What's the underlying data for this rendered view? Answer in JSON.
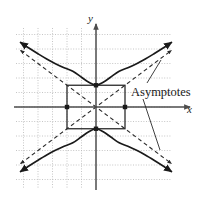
{
  "figure": {
    "background_color": "#ffffff",
    "width": 199,
    "height": 199
  },
  "axes": {
    "x_label": "x",
    "y_label": "y",
    "x_axis_color": "#4d4d4d",
    "y_axis_color": "#4d4d4d",
    "origin_px": {
      "x": 96,
      "y": 107
    },
    "x_axis_end_px": {
      "x": 190,
      "y": 107
    },
    "y_axis_top_px": {
      "x": 96,
      "y": 24
    }
  },
  "grid": {
    "color": "#b8b8b8",
    "style": "dotted",
    "spacing_px": 14.5,
    "left_px": 16,
    "right_px": 172,
    "top_px": 28,
    "bottom_px": 188
  },
  "annotations": [
    {
      "name": "asymptotes-label",
      "text": "Asymptotes",
      "x_px": 131,
      "y_px": 95,
      "leader_lines": [
        {
          "from_x": 147,
          "from_y": 83,
          "to_x": 161,
          "to_y": 60
        },
        {
          "from_x": 143,
          "from_y": 99,
          "to_x": 160,
          "to_y": 150
        }
      ]
    }
  ],
  "chart_data": {
    "type": "line",
    "xlabel": "x",
    "ylabel": "y",
    "xlim": [
      -5.5,
      5.2
    ],
    "ylim": [
      -5.5,
      5.5
    ],
    "grid": true,
    "legend": false,
    "conic": {
      "kind": "hyperbola",
      "orientation": "vertical",
      "center": [
        0,
        0
      ],
      "a": 1.5,
      "b": 2.0,
      "equation": "y^2/a^2 - x^2/b^2 = 1",
      "vertices": [
        [
          0,
          1.5
        ],
        [
          0,
          -1.5
        ]
      ],
      "co_vertices": [
        [
          -2,
          0
        ],
        [
          2,
          0
        ]
      ]
    },
    "central_rectangle": {
      "x_min": -2.0,
      "x_max": 2.0,
      "y_min": -1.5,
      "y_max": 1.5,
      "corner_markers": false,
      "midpoint_markers": [
        [
          0,
          1.5
        ],
        [
          0,
          -1.5
        ],
        [
          -2,
          0
        ],
        [
          2,
          0
        ]
      ],
      "stroke": "#2b2b2b",
      "stroke_width": 1.3
    },
    "series": [
      {
        "name": "upper-branch",
        "style": "solid",
        "stroke": "#1a1a1a",
        "arrow_ends": "both",
        "points": [
          [
            -5.2,
            4.45
          ],
          [
            -4.6,
            4.05
          ],
          [
            -4.0,
            3.67
          ],
          [
            -3.4,
            3.31
          ],
          [
            -2.8,
            2.99
          ],
          [
            -2.2,
            2.71
          ],
          [
            -1.6,
            2.47
          ],
          [
            -1.0,
            2.05
          ],
          [
            -0.5,
            1.71
          ],
          [
            0.0,
            1.5
          ],
          [
            0.5,
            1.71
          ],
          [
            1.0,
            2.05
          ],
          [
            1.6,
            2.47
          ],
          [
            2.2,
            2.71
          ],
          [
            2.8,
            2.99
          ],
          [
            3.4,
            3.31
          ],
          [
            4.0,
            3.67
          ],
          [
            4.6,
            4.05
          ],
          [
            5.2,
            4.45
          ]
        ]
      },
      {
        "name": "lower-branch",
        "style": "solid",
        "stroke": "#1a1a1a",
        "arrow_ends": "both",
        "points": [
          [
            -5.2,
            -4.45
          ],
          [
            -4.6,
            -4.05
          ],
          [
            -4.0,
            -3.67
          ],
          [
            -3.4,
            -3.31
          ],
          [
            -2.8,
            -2.99
          ],
          [
            -2.2,
            -2.71
          ],
          [
            -1.6,
            -2.47
          ],
          [
            -1.0,
            -2.05
          ],
          [
            -0.5,
            -1.71
          ],
          [
            0.0,
            -1.5
          ],
          [
            0.5,
            -1.71
          ],
          [
            1.0,
            -2.05
          ],
          [
            1.6,
            -2.47
          ],
          [
            2.2,
            -2.71
          ],
          [
            2.8,
            -2.99
          ],
          [
            3.4,
            -3.31
          ],
          [
            4.0,
            -3.67
          ],
          [
            4.6,
            -4.05
          ],
          [
            5.2,
            -4.45
          ]
        ]
      },
      {
        "name": "asymptote-positive-slope",
        "style": "dashed",
        "stroke": "#2b2b2b",
        "slope": 0.75,
        "endpoints": [
          [
            -5.2,
            -3.9
          ],
          [
            5.2,
            3.9
          ]
        ]
      },
      {
        "name": "asymptote-negative-slope",
        "style": "dashed",
        "stroke": "#2b2b2b",
        "slope": -0.75,
        "endpoints": [
          [
            -5.2,
            3.9
          ],
          [
            5.2,
            -3.9
          ]
        ]
      }
    ]
  }
}
